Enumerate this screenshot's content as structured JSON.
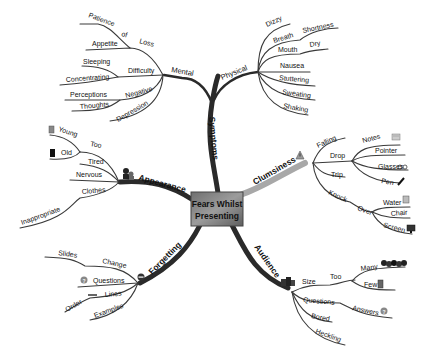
{
  "central": {
    "line1": "Fears Whilst",
    "line2": "Presenting"
  },
  "branches": {
    "symptoms": {
      "label": "Symptoms",
      "mental": {
        "label": "Mental",
        "loss": {
          "label": "Loss",
          "of": "of",
          "items": [
            "Patience",
            "Appetite"
          ]
        },
        "difficulty": {
          "label": "Difficulty",
          "items": [
            "Sleeping",
            "Concentrating"
          ]
        },
        "negative": {
          "label": "Negative",
          "items": [
            "Perceptions",
            "Thoughts"
          ]
        },
        "depression": "Depression"
      },
      "physical": {
        "label": "Physical",
        "dizzy": "Dizzy",
        "breath": {
          "label": "Breath",
          "sub": "Shortness"
        },
        "mouth": {
          "label": "Mouth",
          "sub": "Dry"
        },
        "nausea": "Nausea",
        "stuttering": "Stuttering",
        "sweating": "Sweating",
        "shaking": "Shaking"
      }
    },
    "appearance": {
      "label": "Appearance",
      "too": {
        "label": "Too",
        "items": [
          "Young",
          "Old"
        ]
      },
      "tired": "Tired",
      "nervous": "Nervous",
      "clothes": {
        "label": "Clothes",
        "sub": "Inappropriate"
      }
    },
    "clumsiness": {
      "label": "Clumsiness",
      "falling": "Falling",
      "drop": {
        "label": "Drop",
        "items": [
          "Notes",
          "Pointer",
          "Glasses",
          "Pen"
        ]
      },
      "trip": "Trip",
      "knock": {
        "label": "Knock",
        "over": {
          "label": "Over",
          "items": [
            "Water",
            "Chair",
            "Screen"
          ]
        }
      }
    },
    "forgetting": {
      "label": "Forgetting",
      "change": {
        "label": "Change",
        "sub": "Slides"
      },
      "questions": "Questions",
      "lines": {
        "label": "Lines",
        "sub": "Order"
      },
      "examples": "Examples"
    },
    "audience": {
      "label": "Audience",
      "size": {
        "label": "Size",
        "too": "Too",
        "items": [
          "Many",
          "Few"
        ]
      },
      "questions": {
        "label": "Questions",
        "sub": "Answers"
      },
      "bored": "Bored",
      "heckling": "Heckling"
    }
  },
  "colors": {
    "branch": "#2a2a2a",
    "clumsiness_branch": "#a8a8a8",
    "central_fill_start": "#9a9a9a",
    "central_fill_end": "#5a5a5a"
  }
}
